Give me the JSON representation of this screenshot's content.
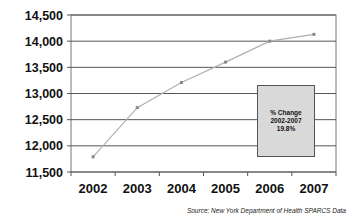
{
  "chart_data": {
    "type": "line",
    "title": "",
    "xlabel": "",
    "ylabel": "",
    "categories": [
      "2002",
      "2003",
      "2004",
      "2005",
      "2006",
      "2007"
    ],
    "series": [
      {
        "name": "Count",
        "values": [
          11790,
          12730,
          13210,
          13600,
          14000,
          14130
        ],
        "color": "#b0b0b0"
      }
    ],
    "yticks": [
      "14,500",
      "14,000",
      "13,500",
      "13,000",
      "12,500",
      "12,000",
      "11,500"
    ],
    "ytick_values": [
      14500,
      14000,
      13500,
      13000,
      12500,
      12000,
      11500
    ],
    "ylim": [
      11500,
      14500
    ],
    "grid": true,
    "legend": "none",
    "annotation": {
      "line1": "% Change",
      "line2": "2002-2007",
      "line3": "19.8%"
    },
    "source": "Source: New York Department of Health SPARCS Data"
  }
}
